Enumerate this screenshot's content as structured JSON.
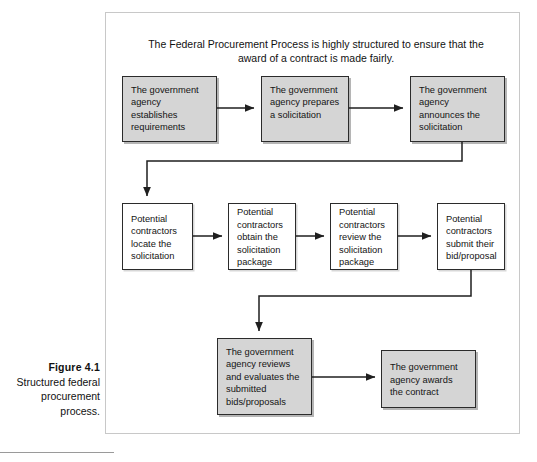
{
  "caption": {
    "figure_number": "Figure 4.1",
    "description": "Structured federal procurement process."
  },
  "diagram": {
    "title": "The Federal Procurement Process is highly structured to ensure that the award of a contract is made fairly.",
    "row1": [
      {
        "id": "establish-requirements",
        "label": "The government agency establishes requirements"
      },
      {
        "id": "prepare-solicitation",
        "label": "The government agency prepares a solicitation"
      },
      {
        "id": "announce-solicitation",
        "label": "The government agency announces the solicitation"
      }
    ],
    "row2": [
      {
        "id": "locate-solicitation",
        "label": "Potential contractors locate the solicitation"
      },
      {
        "id": "obtain-package",
        "label": "Potential contractors obtain the solicitation package"
      },
      {
        "id": "review-package",
        "label": "Potential contractors review the solicitation package"
      },
      {
        "id": "submit-bid",
        "label": "Potential contractors submit their bid/proposal"
      }
    ],
    "row3": [
      {
        "id": "review-evaluate-bids",
        "label": "The government agency reviews and evaluates the submitted bids/proposals"
      },
      {
        "id": "award-contract",
        "label": "The government agency awards the contract"
      }
    ],
    "colors": {
      "shaded_fill": "#d5d5d5",
      "node_border": "#2b2b2b",
      "frame_border": "#c8c8c8",
      "connector": "#1f1f1f",
      "text": "#141414"
    }
  }
}
